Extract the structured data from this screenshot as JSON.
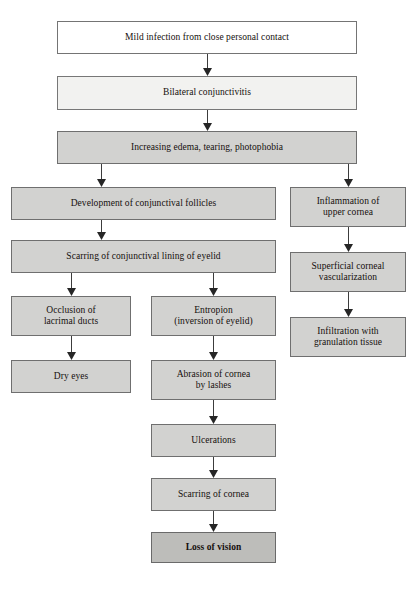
{
  "diagram": {
    "colors": {
      "box_white": "#ffffff",
      "box_light_gray": "#f2f2f0",
      "box_mid_gray": "#d2d2d0",
      "box_dark_gray": "#bdbdba",
      "border": "#6d6d6d",
      "text": "#15100d",
      "arrow": "#3c3c3c"
    },
    "nodes": [
      {
        "id": "n1",
        "label": "Mild infection from close personal contact",
        "shade": "white",
        "bold": false
      },
      {
        "id": "n2",
        "label": "Bilateral conjunctivitis",
        "shade": "light",
        "bold": false
      },
      {
        "id": "n3",
        "label": "Increasing edema, tearing, photophobia",
        "shade": "mid",
        "bold": false
      },
      {
        "id": "n4",
        "label": "Development of conjunctival follicles",
        "shade": "mid",
        "bold": false
      },
      {
        "id": "n5",
        "label": "Scarring of conjunctival lining of eyelid",
        "shade": "mid",
        "bold": false
      },
      {
        "id": "n6",
        "label": "Occlusion of\nlacrimal ducts",
        "shade": "mid",
        "bold": false
      },
      {
        "id": "n7",
        "label": "Dry eyes",
        "shade": "mid",
        "bold": false
      },
      {
        "id": "n8",
        "label": "Entropion\n(inversion of eyelid)",
        "shade": "mid",
        "bold": false
      },
      {
        "id": "n9",
        "label": "Abrasion of cornea\nby lashes",
        "shade": "mid",
        "bold": false
      },
      {
        "id": "n10",
        "label": "Ulcerations",
        "shade": "mid",
        "bold": false
      },
      {
        "id": "n11",
        "label": "Scarring of cornea",
        "shade": "mid",
        "bold": false
      },
      {
        "id": "n12",
        "label": "Loss of vision",
        "shade": "dark",
        "bold": true
      },
      {
        "id": "n13",
        "label": "Inflammation of\nupper cornea",
        "shade": "mid",
        "bold": false
      },
      {
        "id": "n14",
        "label": "Superficial corneal\nvascularization",
        "shade": "mid",
        "bold": false
      },
      {
        "id": "n15",
        "label": "Infiltration with\ngranulation tissue",
        "shade": "mid",
        "bold": false
      }
    ],
    "edges": [
      {
        "from": "n1",
        "to": "n2"
      },
      {
        "from": "n2",
        "to": "n3"
      },
      {
        "from": "n3",
        "to": "n4"
      },
      {
        "from": "n3",
        "to": "n13"
      },
      {
        "from": "n4",
        "to": "n5"
      },
      {
        "from": "n5",
        "to": "n6"
      },
      {
        "from": "n5",
        "to": "n8"
      },
      {
        "from": "n6",
        "to": "n7"
      },
      {
        "from": "n8",
        "to": "n9"
      },
      {
        "from": "n9",
        "to": "n10"
      },
      {
        "from": "n10",
        "to": "n11"
      },
      {
        "from": "n11",
        "to": "n12"
      },
      {
        "from": "n13",
        "to": "n14"
      },
      {
        "from": "n14",
        "to": "n15"
      }
    ]
  }
}
